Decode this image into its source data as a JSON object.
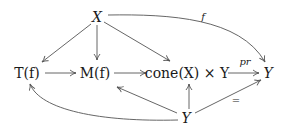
{
  "diagram": {
    "type": "commutative-diagram",
    "nodes": {
      "X": {
        "label": "X",
        "x": 97,
        "y": 17
      },
      "Tf": {
        "label": "T(f)",
        "x": 27,
        "y": 73
      },
      "Mf": {
        "label": "M(f)",
        "x": 95,
        "y": 73
      },
      "cone": {
        "label": "cone(X) × Y",
        "x": 186,
        "y": 73
      },
      "Yright": {
        "label": "Y",
        "x": 267,
        "y": 73
      },
      "Ybottom": {
        "label": "Y",
        "x": 185,
        "y": 117
      }
    },
    "edge_labels": {
      "f": "f",
      "pr": "pr",
      "eq": "="
    },
    "edges": [
      {
        "from": "X",
        "to": "Tf"
      },
      {
        "from": "X",
        "to": "Mf"
      },
      {
        "from": "X",
        "to": "cone"
      },
      {
        "from": "X",
        "to": "Yright",
        "label": "f",
        "curved": true
      },
      {
        "from": "Tf",
        "to": "Mf"
      },
      {
        "from": "Mf",
        "to": "cone"
      },
      {
        "from": "cone",
        "to": "Yright",
        "label": "pr"
      },
      {
        "from": "Ybottom",
        "to": "Tf",
        "curved": true
      },
      {
        "from": "Ybottom",
        "to": "Mf"
      },
      {
        "from": "Ybottom",
        "to": "cone"
      },
      {
        "from": "Ybottom",
        "to": "Yright",
        "label": "="
      }
    ],
    "colors": {
      "stroke": "#555555",
      "text": "#1a1a1a",
      "background": "#ffffff"
    }
  }
}
